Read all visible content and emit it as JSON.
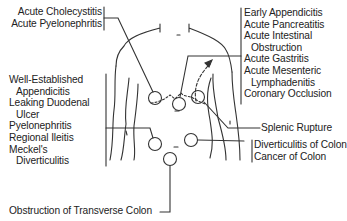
{
  "diagram": {
    "type": "anatomical-pain-map",
    "groups": {
      "upper_left": {
        "lines": [
          "Acute Cholecystitis",
          "Acute Pyelonephritis"
        ]
      },
      "left": {
        "lines": [
          "Well-Established",
          "Appendicitis",
          "Leaking Duodenal",
          "Ulcer",
          "Pyelonephritis",
          "Regional Ileitis",
          "Meckel's",
          "Diverticulitis"
        ]
      },
      "upper_right": {
        "lines": [
          "Early Appendicitis",
          "Acute Pancreatitis",
          "Acute Intestinal",
          "Obstruction",
          "Acute Gastritis",
          "Acute Mesenteric",
          "Lymphadenitis",
          "Coronary Occlusion"
        ]
      },
      "splenic": {
        "lines": [
          "Splenic Rupture"
        ]
      },
      "lower_right": {
        "lines": [
          "Diverticulitis of Colon",
          "Cancer of Colon"
        ]
      },
      "bottom": {
        "lines": [
          "Obstruction of Transverse Colon"
        ]
      }
    },
    "colors": {
      "line": "#333333",
      "text": "#222222",
      "background": "#ffffff"
    }
  }
}
